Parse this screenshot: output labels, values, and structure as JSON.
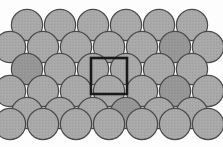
{
  "figure": {
    "type": "lattice-packing-diagram",
    "width": 223,
    "height": 147,
    "background_color": "#fdfdfd"
  },
  "atom_style": {
    "fill_color": "#a8a8a8",
    "fill_color_alt": "#9a9a9a",
    "stroke_color": "#4a4a4a",
    "stroke_width": 1.2,
    "radius": 15.6
  },
  "unit_cell": {
    "label": "unit cell",
    "shape": "square",
    "stroke_color": "#1a1a1a",
    "stroke_width": 2.6,
    "fill": "none",
    "x": 91,
    "y": 58,
    "size": 36
  },
  "lattice": {
    "description": "Six rows of circles in an alternating offset (close-packed) arrangement",
    "row_spacing": 22,
    "column_spacing": 33,
    "rows": [
      {
        "index": 0,
        "count": 6,
        "offset": "even",
        "cy": 25,
        "start_cx": 27
      },
      {
        "index": 1,
        "count": 7,
        "offset": "odd",
        "cy": 47,
        "start_cx": 10
      },
      {
        "index": 2,
        "count": 6,
        "offset": "even",
        "cy": 69,
        "start_cx": 27
      },
      {
        "index": 3,
        "count": 7,
        "offset": "odd",
        "cy": 91,
        "start_cx": 10
      },
      {
        "index": 4,
        "count": 6,
        "offset": "even",
        "cy": 113,
        "start_cx": 27
      },
      {
        "index": 5,
        "count": 7,
        "offset": "odd",
        "cy": 124,
        "start_cx": 10
      }
    ],
    "atoms": [
      {
        "cx": 27,
        "cy": 25,
        "row": 0,
        "col": 0,
        "shade": "light"
      },
      {
        "cx": 60,
        "cy": 25,
        "row": 0,
        "col": 1,
        "shade": "light"
      },
      {
        "cx": 93,
        "cy": 25,
        "row": 0,
        "col": 2,
        "shade": "light"
      },
      {
        "cx": 126,
        "cy": 25,
        "row": 0,
        "col": 3,
        "shade": "light"
      },
      {
        "cx": 159,
        "cy": 25,
        "row": 0,
        "col": 4,
        "shade": "light"
      },
      {
        "cx": 192,
        "cy": 25,
        "row": 0,
        "col": 5,
        "shade": "light"
      },
      {
        "cx": 10,
        "cy": 47,
        "row": 1,
        "col": 0,
        "shade": "light"
      },
      {
        "cx": 43,
        "cy": 47,
        "row": 1,
        "col": 1,
        "shade": "light"
      },
      {
        "cx": 76,
        "cy": 47,
        "row": 1,
        "col": 2,
        "shade": "light"
      },
      {
        "cx": 109,
        "cy": 47,
        "row": 1,
        "col": 3,
        "shade": "light"
      },
      {
        "cx": 142,
        "cy": 47,
        "row": 1,
        "col": 4,
        "shade": "light"
      },
      {
        "cx": 175,
        "cy": 47,
        "row": 1,
        "col": 5,
        "shade": "dark"
      },
      {
        "cx": 208,
        "cy": 47,
        "row": 1,
        "col": 6,
        "shade": "light"
      },
      {
        "cx": 27,
        "cy": 69,
        "row": 2,
        "col": 0,
        "shade": "dark"
      },
      {
        "cx": 60,
        "cy": 69,
        "row": 2,
        "col": 1,
        "shade": "light"
      },
      {
        "cx": 93,
        "cy": 69,
        "row": 2,
        "col": 2,
        "shade": "light"
      },
      {
        "cx": 126,
        "cy": 69,
        "row": 2,
        "col": 3,
        "shade": "light"
      },
      {
        "cx": 159,
        "cy": 69,
        "row": 2,
        "col": 4,
        "shade": "light"
      },
      {
        "cx": 192,
        "cy": 69,
        "row": 2,
        "col": 5,
        "shade": "light"
      },
      {
        "cx": 10,
        "cy": 91,
        "row": 3,
        "col": 0,
        "shade": "light"
      },
      {
        "cx": 43,
        "cy": 91,
        "row": 3,
        "col": 1,
        "shade": "light"
      },
      {
        "cx": 76,
        "cy": 91,
        "row": 3,
        "col": 2,
        "shade": "light"
      },
      {
        "cx": 109,
        "cy": 91,
        "row": 3,
        "col": 3,
        "shade": "light"
      },
      {
        "cx": 142,
        "cy": 91,
        "row": 3,
        "col": 4,
        "shade": "light"
      },
      {
        "cx": 175,
        "cy": 91,
        "row": 3,
        "col": 5,
        "shade": "dark"
      },
      {
        "cx": 208,
        "cy": 91,
        "row": 3,
        "col": 6,
        "shade": "light"
      },
      {
        "cx": 27,
        "cy": 113,
        "row": 4,
        "col": 0,
        "shade": "light"
      },
      {
        "cx": 60,
        "cy": 113,
        "row": 4,
        "col": 1,
        "shade": "light"
      },
      {
        "cx": 93,
        "cy": 113,
        "row": 4,
        "col": 2,
        "shade": "light"
      },
      {
        "cx": 126,
        "cy": 113,
        "row": 4,
        "col": 3,
        "shade": "dark"
      },
      {
        "cx": 159,
        "cy": 113,
        "row": 4,
        "col": 4,
        "shade": "light"
      },
      {
        "cx": 192,
        "cy": 113,
        "row": 4,
        "col": 5,
        "shade": "light"
      },
      {
        "cx": 10,
        "cy": 124,
        "row": 5,
        "col": 0,
        "shade": "light"
      },
      {
        "cx": 43,
        "cy": 124,
        "row": 5,
        "col": 1,
        "shade": "light"
      },
      {
        "cx": 76,
        "cy": 124,
        "row": 5,
        "col": 2,
        "shade": "light"
      },
      {
        "cx": 109,
        "cy": 124,
        "row": 5,
        "col": 3,
        "shade": "light"
      },
      {
        "cx": 142,
        "cy": 124,
        "row": 5,
        "col": 4,
        "shade": "light"
      },
      {
        "cx": 175,
        "cy": 124,
        "row": 5,
        "col": 5,
        "shade": "light"
      },
      {
        "cx": 208,
        "cy": 124,
        "row": 5,
        "col": 6,
        "shade": "light"
      }
    ]
  }
}
